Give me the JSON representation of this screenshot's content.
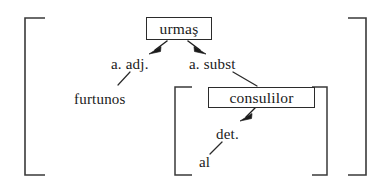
{
  "figure": {
    "kind": "syntactic-bracket-diagram",
    "language": "Romanian",
    "background_color": "#ffffff",
    "ink_color": "#1a1a1a"
  },
  "nodes": [
    {
      "id": "urmas",
      "label": "urmaş",
      "role": "head-noun",
      "boxed": true
    },
    {
      "id": "consulilor",
      "label": "consulilor",
      "role": "embedded-head-noun",
      "boxed": true
    }
  ],
  "edge_labels": [
    {
      "id": "a-adj",
      "label": "a. adj.",
      "attaches_to": "furtunos"
    },
    {
      "id": "a-subst",
      "label": "a. subst",
      "attaches_to": "consulilor"
    },
    {
      "id": "det",
      "label": "det.",
      "attaches_to": "al"
    }
  ],
  "terminals": [
    {
      "id": "furtunos",
      "label": "furtunos"
    },
    {
      "id": "al",
      "label": "al"
    }
  ],
  "brackets": [
    {
      "id": "outer",
      "style": "square",
      "side": "left"
    },
    {
      "id": "outer",
      "style": "square",
      "side": "right"
    },
    {
      "id": "inner",
      "style": "square",
      "side": "left"
    },
    {
      "id": "inner",
      "style": "square",
      "side": "right"
    }
  ],
  "arrows": [
    {
      "id": "arrow-urmas-left",
      "from": "urmas",
      "to": "a-adj",
      "direction": "down-left"
    },
    {
      "id": "arrow-urmas-right",
      "from": "urmas",
      "to": "a-subst",
      "direction": "down-right"
    },
    {
      "id": "arrow-consulilor",
      "from": "consulilor",
      "to": "det",
      "direction": "down-left"
    }
  ]
}
